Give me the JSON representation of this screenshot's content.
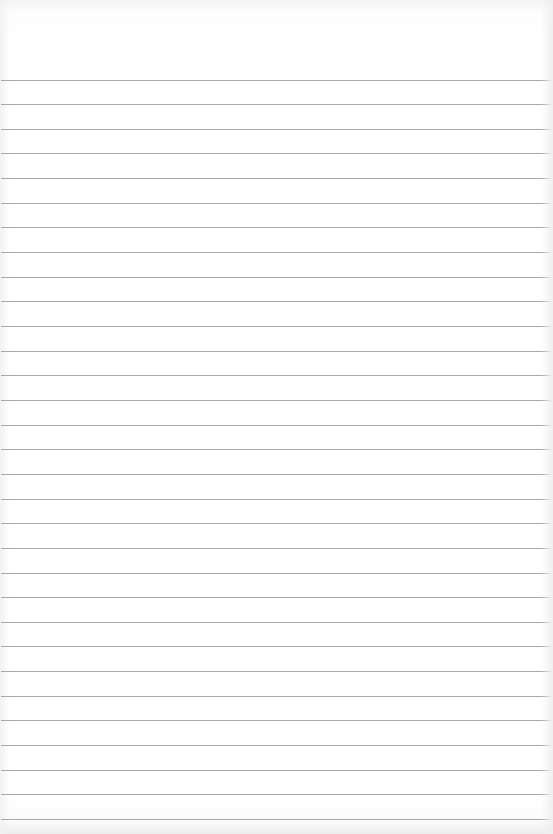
{
  "page": {
    "type": "lined-notebook-paper",
    "content_text": "",
    "background_color": "#ffffff",
    "rule_color": "#9a9a9a",
    "rule_count": 31,
    "first_rule_y": 79.5,
    "rule_spacing": 24.65
  }
}
